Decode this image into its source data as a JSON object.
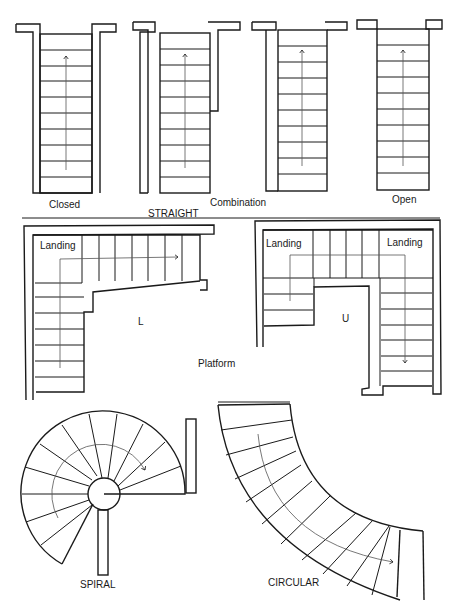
{
  "figure": {
    "groups": {
      "straight": "STRAIGHT",
      "platform": "Platform",
      "spiral": "SPIRAL",
      "circular": "CIRCULAR"
    },
    "straight_types": [
      {
        "label": "Closed",
        "treads": 10
      },
      {
        "label": "Combination",
        "treads": 10
      },
      {
        "label": "",
        "treads": 10
      },
      {
        "label": "Open",
        "treads": 10
      }
    ],
    "platform_types": [
      {
        "label": "L",
        "landings": [
          "Landing"
        ]
      },
      {
        "label": "U",
        "landings": [
          "Landing",
          "Landing"
        ]
      }
    ],
    "spiral": {
      "treads": 12
    },
    "circular": {
      "treads": 13
    },
    "colors": {
      "line": "#1a1a1a",
      "background": "#ffffff"
    }
  }
}
